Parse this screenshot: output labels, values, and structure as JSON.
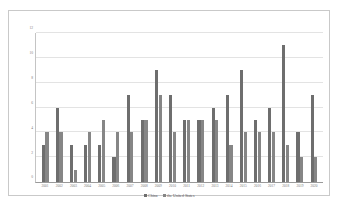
{
  "chart_data": {
    "type": "bar",
    "title": "",
    "xlabel": "",
    "ylabel": "",
    "ylim": [
      0,
      12
    ],
    "yticks": [
      0,
      2,
      4,
      6,
      8,
      10,
      12
    ],
    "grid": true,
    "legend_position": "bottom",
    "categories": [
      "2001",
      "2002",
      "2003",
      "2004",
      "2005",
      "2006",
      "2007",
      "2008",
      "2009",
      "2010",
      "2011",
      "2012",
      "2013",
      "2014",
      "2015",
      "2016",
      "2017",
      "2018",
      "2019",
      "2020"
    ],
    "series": [
      {
        "name": "China",
        "color": "#6e6e6e",
        "values": [
          3,
          6,
          3,
          3,
          3,
          2,
          7,
          5,
          9,
          7,
          5,
          5,
          6,
          7,
          9,
          5,
          6,
          11,
          4,
          7
        ]
      },
      {
        "name": "the United States",
        "color": "#868686",
        "values": [
          4,
          4,
          1,
          4,
          5,
          4,
          4,
          5,
          7,
          4,
          5,
          5,
          5,
          3,
          4,
          4,
          4,
          3,
          2,
          2
        ]
      }
    ]
  },
  "legend": {
    "items": [
      {
        "label": "China"
      },
      {
        "label": "the United States"
      }
    ]
  }
}
